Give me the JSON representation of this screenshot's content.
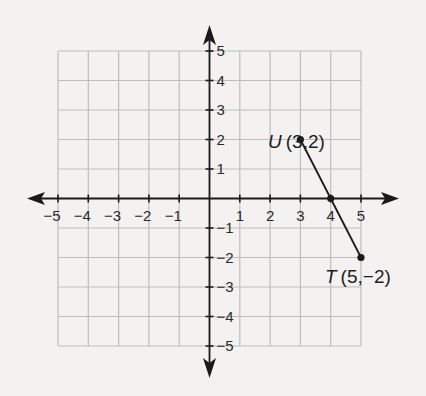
{
  "diagram": {
    "type": "coordinate-plane",
    "x_range": [
      -5,
      5
    ],
    "y_range": [
      -5,
      5
    ],
    "grid": true,
    "colors": {
      "background": "#f3f2f0",
      "grid": "#bdbdbd",
      "axis": "#1a1a1a",
      "segment": "#1a1a1a"
    },
    "x_tick_labels": [
      "−5",
      "−4",
      "−3",
      "−2",
      "−1",
      "1",
      "2",
      "3",
      "4",
      "5"
    ],
    "y_tick_labels": [
      "5",
      "4",
      "3",
      "2",
      "1",
      "−1",
      "−2",
      "−3",
      "−4",
      "−5"
    ],
    "points": [
      {
        "name": "U",
        "coords": "(3,2)",
        "x": 3,
        "y": 2
      },
      {
        "name": "T",
        "coords": "(5,−2)",
        "x": 5,
        "y": -2
      },
      {
        "name": "",
        "coords": "",
        "x": 4,
        "y": 0
      }
    ],
    "segment": {
      "from": "U",
      "to": "T"
    }
  }
}
